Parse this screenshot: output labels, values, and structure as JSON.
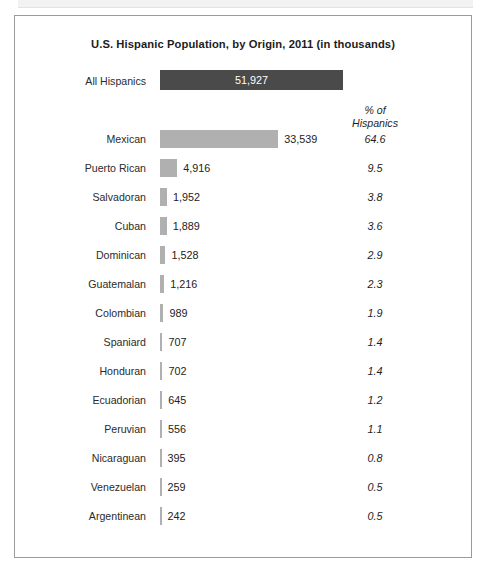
{
  "chart_data": {
    "type": "bar",
    "title": "U.S. Hispanic Population, by Origin, 2011 (in thousands)",
    "xlabel": "",
    "ylabel": "",
    "orientation": "horizontal",
    "units": "thousands",
    "grid": false,
    "legend": null,
    "pct_column_header_line1": "% of",
    "pct_column_header_line2": "Hispanics",
    "total": {
      "label": "All Hispanics",
      "value": 51927,
      "value_text": "51,927",
      "bar_color": "#4a4a4a",
      "value_position": "inside"
    },
    "bar_color": "#b0b0b0",
    "categories": [
      "Mexican",
      "Puerto Rican",
      "Salvadoran",
      "Cuban",
      "Dominican",
      "Guatemalan",
      "Colombian",
      "Spaniard",
      "Honduran",
      "Ecuadorian",
      "Peruvian",
      "Nicaraguan",
      "Venezuelan",
      "Argentinean"
    ],
    "values": [
      33539,
      4916,
      1952,
      1889,
      1528,
      1216,
      989,
      707,
      702,
      645,
      556,
      395,
      259,
      242
    ],
    "value_labels": [
      "33,539",
      "4,916",
      "1,952",
      "1,889",
      "1,528",
      "1,216",
      "989",
      "707",
      "702",
      "645",
      "556",
      "395",
      "259",
      "242"
    ],
    "percents": [
      64.6,
      9.5,
      3.8,
      3.6,
      2.9,
      2.3,
      1.9,
      1.4,
      1.4,
      1.2,
      1.1,
      0.8,
      0.5,
      0.5
    ],
    "percent_labels": [
      "64.6",
      "9.5",
      "3.8",
      "3.6",
      "2.9",
      "2.3",
      "1.9",
      "1.4",
      "1.4",
      "1.2",
      "1.1",
      "0.8",
      "0.5",
      "0.5"
    ],
    "xlim": [
      0,
      51927
    ]
  },
  "rows": [
    {
      "label": "Mexican",
      "value_text": "33,539",
      "pct": "64.6",
      "value": 33539
    },
    {
      "label": "Puerto Rican",
      "value_text": "4,916",
      "pct": "9.5",
      "value": 4916
    },
    {
      "label": "Salvadoran",
      "value_text": "1,952",
      "pct": "3.8",
      "value": 1952
    },
    {
      "label": "Cuban",
      "value_text": "1,889",
      "pct": "3.6",
      "value": 1889
    },
    {
      "label": "Dominican",
      "value_text": "1,528",
      "pct": "2.9",
      "value": 1528
    },
    {
      "label": "Guatemalan",
      "value_text": "1,216",
      "pct": "2.3",
      "value": 1216
    },
    {
      "label": "Colombian",
      "value_text": "989",
      "pct": "1.9",
      "value": 989
    },
    {
      "label": "Spaniard",
      "value_text": "707",
      "pct": "1.4",
      "value": 707
    },
    {
      "label": "Honduran",
      "value_text": "702",
      "pct": "1.4",
      "value": 702
    },
    {
      "label": "Ecuadorian",
      "value_text": "645",
      "pct": "1.2",
      "value": 645
    },
    {
      "label": "Peruvian",
      "value_text": "556",
      "pct": "1.1",
      "value": 556
    },
    {
      "label": "Nicaraguan",
      "value_text": "395",
      "pct": "0.8",
      "value": 395
    },
    {
      "label": "Venezuelan",
      "value_text": "259",
      "pct": "0.5",
      "value": 259
    },
    {
      "label": "Argentinean",
      "value_text": "242",
      "pct": "0.5",
      "value": 242
    }
  ]
}
